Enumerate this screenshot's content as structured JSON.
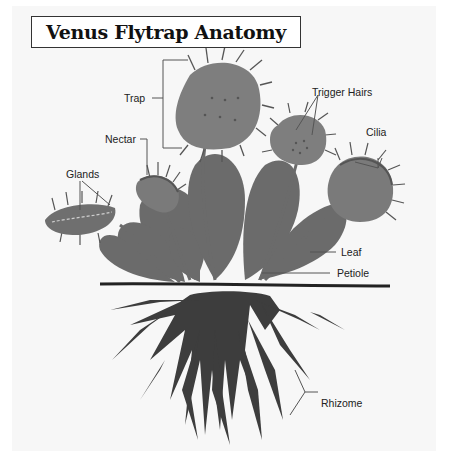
{
  "title": "Venus Flytrap Anatomy",
  "labels": {
    "trap": "Trap",
    "nectar": "Nectar",
    "glands": "Glands",
    "trigger_hairs": "Trigger Hairs",
    "cilia": "Cilia",
    "leaf": "Leaf",
    "petiole": "Petiole",
    "rhizome": "Rhizome"
  },
  "colors": {
    "plant": "#6b6b6b",
    "trap": "#7e7e7e",
    "root": "#3c3c3c",
    "background": "#f7f7f7",
    "leader_line": "#555555"
  }
}
